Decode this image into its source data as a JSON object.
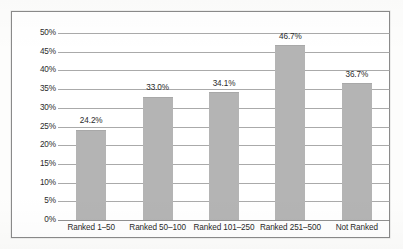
{
  "chart_data": {
    "type": "bar",
    "title": "",
    "xlabel": "",
    "ylabel": "",
    "categories": [
      "Ranked 1–50",
      "Ranked 50–100",
      "Ranked 101–250",
      "Ranked 251–500",
      "Not Ranked"
    ],
    "values": [
      24.2,
      33.0,
      34.1,
      46.7,
      36.7
    ],
    "value_labels": [
      "24.2%",
      "33.0%",
      "34.1%",
      "46.7%",
      "36.7%"
    ],
    "ylim": [
      0,
      50
    ],
    "ytick_labels": [
      "50%",
      "45%",
      "40%",
      "35%",
      "30%",
      "25%",
      "20%",
      "15%",
      "10%",
      "5%",
      "0%"
    ],
    "ytick_values": [
      50,
      45,
      40,
      35,
      30,
      25,
      20,
      15,
      10,
      5,
      0
    ],
    "grid": "horizontal",
    "legend": "none",
    "colors": {
      "bar_fill": "#b4b4b4",
      "gridline": "#9b9b9b",
      "text": "#2b2b2b",
      "frame_border": "#8a8a8a",
      "plot_background": "#ffffff"
    }
  }
}
